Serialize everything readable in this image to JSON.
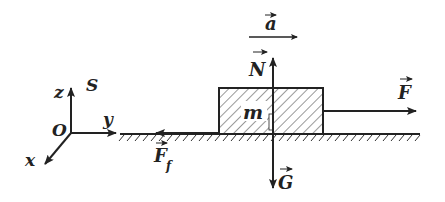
{
  "diagram": {
    "colors": {
      "ink": "#222222",
      "background": "#ffffff"
    },
    "axes": {
      "origin_label": "O",
      "frame_label": "S",
      "x_label": "x",
      "y_label": "y",
      "z_label": "z"
    },
    "block": {
      "label": "m"
    },
    "vectors": {
      "acceleration": {
        "label": "a",
        "arrow_over": "→"
      },
      "normal": {
        "label": "N",
        "arrow_over": "→"
      },
      "gravity": {
        "label": "G",
        "arrow_over": "→"
      },
      "applied": {
        "label": "F",
        "arrow_over": "→"
      },
      "friction": {
        "label": "F",
        "subscript": "f",
        "arrow_over": "→"
      }
    }
  }
}
